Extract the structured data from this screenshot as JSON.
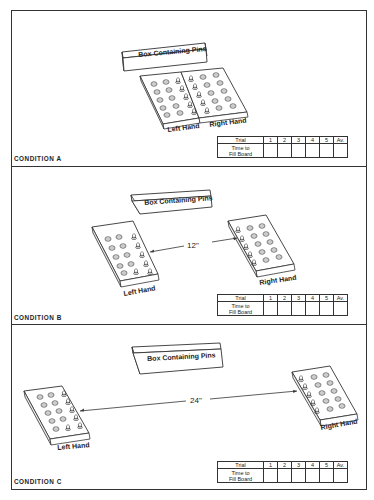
{
  "conditions": [
    {
      "id": "A",
      "label": "CONDITION A",
      "box_label": "Box Containing Pins",
      "left_label": "Left Hand",
      "right_label": "Right Hand",
      "distance": ""
    },
    {
      "id": "B",
      "label": "CONDITION B",
      "box_label": "Box Containing Pins",
      "left_label": "Left Hand",
      "right_label": "Right Hand",
      "distance": "12\""
    },
    {
      "id": "C",
      "label": "CONDITION C",
      "box_label": "Box Containing Pins",
      "left_label": "Left Hand",
      "right_label": "Right Hand",
      "distance": "24\""
    }
  ],
  "table": {
    "row1_header": "Trial",
    "columns": [
      "1",
      "2",
      "3",
      "4",
      "5",
      "Av."
    ],
    "row2_header_line1": "Time to",
    "row2_header_line2": "Fill Board",
    "row2_values": [
      "",
      "",
      "",
      "",
      "",
      ""
    ]
  }
}
